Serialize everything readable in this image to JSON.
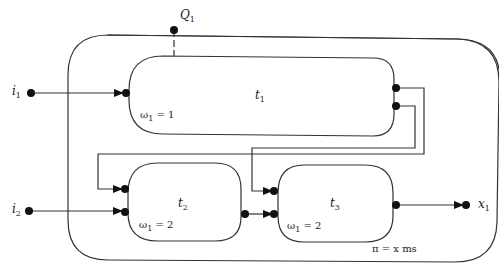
{
  "diagram": {
    "composite": {
      "pi_label": "π = x ms"
    },
    "query": {
      "name": "Q",
      "sub": "1"
    },
    "inputs": [
      {
        "name": "i",
        "sub": "1"
      },
      {
        "name": "i",
        "sub": "2"
      }
    ],
    "output": {
      "name": "x",
      "sub": "1"
    },
    "tasks": [
      {
        "name": "t",
        "sub": "1",
        "omega": "ω",
        "omega_sub": "1",
        "omega_val": " = 1"
      },
      {
        "name": "t",
        "sub": "2",
        "omega": "ω",
        "omega_sub": "1",
        "omega_val": " = 2"
      },
      {
        "name": "t",
        "sub": "3",
        "omega": "ω",
        "omega_sub": "1",
        "omega_val": " = 2"
      }
    ]
  }
}
